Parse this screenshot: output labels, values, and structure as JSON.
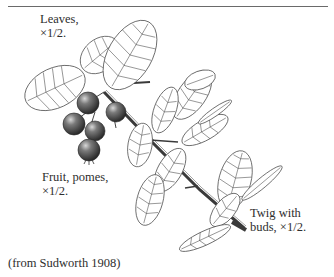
{
  "figure": {
    "labels": {
      "leaves": {
        "line1": "Leaves,",
        "line2": "×1/2."
      },
      "fruit": {
        "line1": "Fruit, pomes,",
        "line2": "×1/2."
      },
      "twig": {
        "line1": "Twig with",
        "line2": "buds, ×1/2."
      }
    },
    "credit": "(from Sudworth 1908)",
    "colors": {
      "ink": "#3a3a3a",
      "fruit": "#4a4a4a",
      "rule": "#6a6a6a",
      "background": "#ffffff"
    }
  }
}
